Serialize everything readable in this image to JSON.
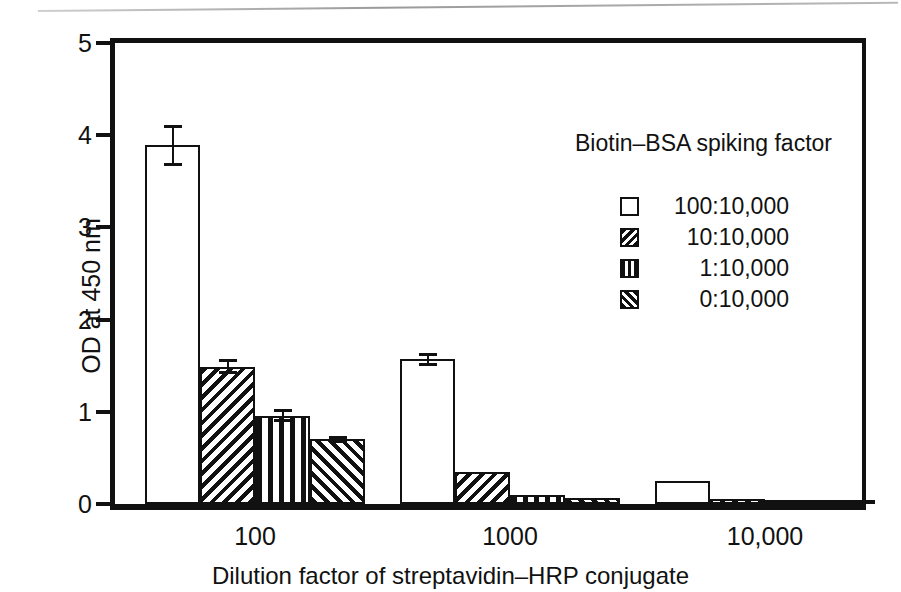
{
  "chart_data": {
    "type": "bar",
    "title": "",
    "xlabel": "Dilution factor of streptavidin–HRP conjugate",
    "ylabel": "OD at 450 nm",
    "ylim": [
      0,
      5
    ],
    "yticks": [
      "0",
      "1",
      "2",
      "3",
      "4",
      "5"
    ],
    "grid": false,
    "legend_position": "inside-upper-right",
    "legend_title": "Biotin–BSA spiking factor",
    "categories": [
      "100",
      "1000",
      "10,000"
    ],
    "series": [
      {
        "name": "100:10,000",
        "pattern": "open",
        "values": [
          3.89,
          1.57,
          0.25
        ],
        "errors": [
          0.22,
          0.07,
          0.02
        ]
      },
      {
        "name": "10:10,000",
        "pattern": "back-hatch",
        "values": [
          1.49,
          0.35,
          0.05
        ],
        "errors": [
          0.08,
          0.02,
          0.01
        ]
      },
      {
        "name": "1:10,000",
        "pattern": "vertical",
        "values": [
          0.96,
          0.1,
          0.02
        ],
        "errors": [
          0.07,
          0.01,
          0.0
        ]
      },
      {
        "name": "0:10,000",
        "pattern": "fwd-hatch",
        "values": [
          0.7,
          0.07,
          0.02
        ],
        "errors": [
          0.04,
          0.01,
          0.0
        ]
      }
    ]
  },
  "axes": {
    "y_label": "OD at 450 nm",
    "y_ticks": [
      "0",
      "1",
      "2",
      "3",
      "4",
      "5"
    ],
    "x_ticks": [
      "100",
      "1000",
      "10,000"
    ],
    "x_title": "Dilution factor of streptavidin–HRP conjugate"
  },
  "legend": {
    "title": "Biotin–BSA spiking factor",
    "items": [
      {
        "label": "100:10,000"
      },
      {
        "label": "10:10,000"
      },
      {
        "label": "1:10,000"
      },
      {
        "label": "0:10,000"
      }
    ]
  }
}
